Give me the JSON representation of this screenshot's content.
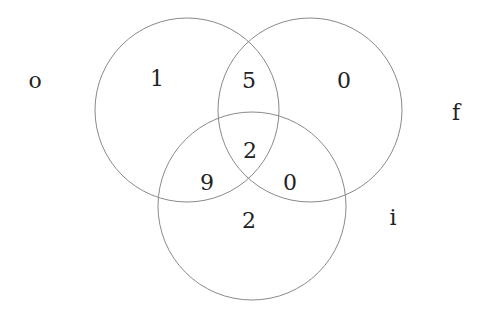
{
  "diagram": {
    "type": "venn3",
    "sets": [
      {
        "name": "o",
        "cx": 187,
        "cy": 110,
        "r": 92,
        "label_x": 35,
        "label_y": 88
      },
      {
        "name": "f",
        "cx": 310,
        "cy": 110,
        "r": 92,
        "label_x": 456,
        "label_y": 120
      },
      {
        "name": "i",
        "cx": 252,
        "cy": 206,
        "r": 94,
        "label_x": 393,
        "label_y": 225
      }
    ],
    "regions": [
      {
        "region": "o only",
        "value": "1",
        "x": 157,
        "y": 86
      },
      {
        "region": "o and f",
        "value": "5",
        "x": 249,
        "y": 88
      },
      {
        "region": "f only",
        "value": "0",
        "x": 344,
        "y": 88
      },
      {
        "region": "o and f and i",
        "value": "2",
        "x": 250,
        "y": 158
      },
      {
        "region": "o and i",
        "value": "9",
        "x": 207,
        "y": 190
      },
      {
        "region": "f and i",
        "value": "0",
        "x": 290,
        "y": 190
      },
      {
        "region": "i only",
        "value": "2",
        "x": 249,
        "y": 228
      }
    ],
    "stroke_color": "#8a8a8a"
  }
}
